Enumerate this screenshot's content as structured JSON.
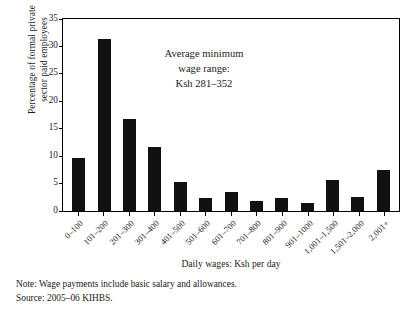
{
  "figure": {
    "ylabel_lines": [
      "Percentage of formal private",
      "sector paid employees"
    ],
    "xlabel": "Daily wages: Ksh per day",
    "annotation_lines": [
      "Average minimum",
      "wage range:",
      "Ksh 281–352"
    ],
    "note": "Note: Wage payments include basic salary and allowances.",
    "source": "Source: 2005–06 KIHBS.",
    "bar_color": "#111111",
    "frame_color": "#000000"
  },
  "chart_data": {
    "type": "bar",
    "title": "",
    "xlabel": "Daily wages: Ksh per day",
    "ylabel": "Percentage of formal private sector paid employees",
    "categories": [
      "0–100",
      "101–200",
      "201–300",
      "301–400",
      "401–500",
      "501–600",
      "601–700",
      "701–800",
      "801–900",
      "901–1000",
      "1,001–1,500",
      "1,501–2,000",
      "2,001+"
    ],
    "values": [
      9.7,
      31.3,
      16.8,
      11.6,
      5.2,
      2.3,
      3.5,
      1.8,
      2.4,
      1.5,
      5.7,
      2.6,
      7.4
    ],
    "ylim": [
      0,
      35
    ],
    "yticks": [
      0,
      5,
      10,
      15,
      20,
      25,
      30,
      35
    ],
    "ytick_labels": [
      "0",
      "5",
      "10",
      "15",
      "20",
      "25",
      "30",
      "35"
    ],
    "grid": false,
    "legend": false,
    "annotations": [
      {
        "text": "Average minimum wage range: Ksh 281–352",
        "x_range": "281–352"
      }
    ]
  }
}
